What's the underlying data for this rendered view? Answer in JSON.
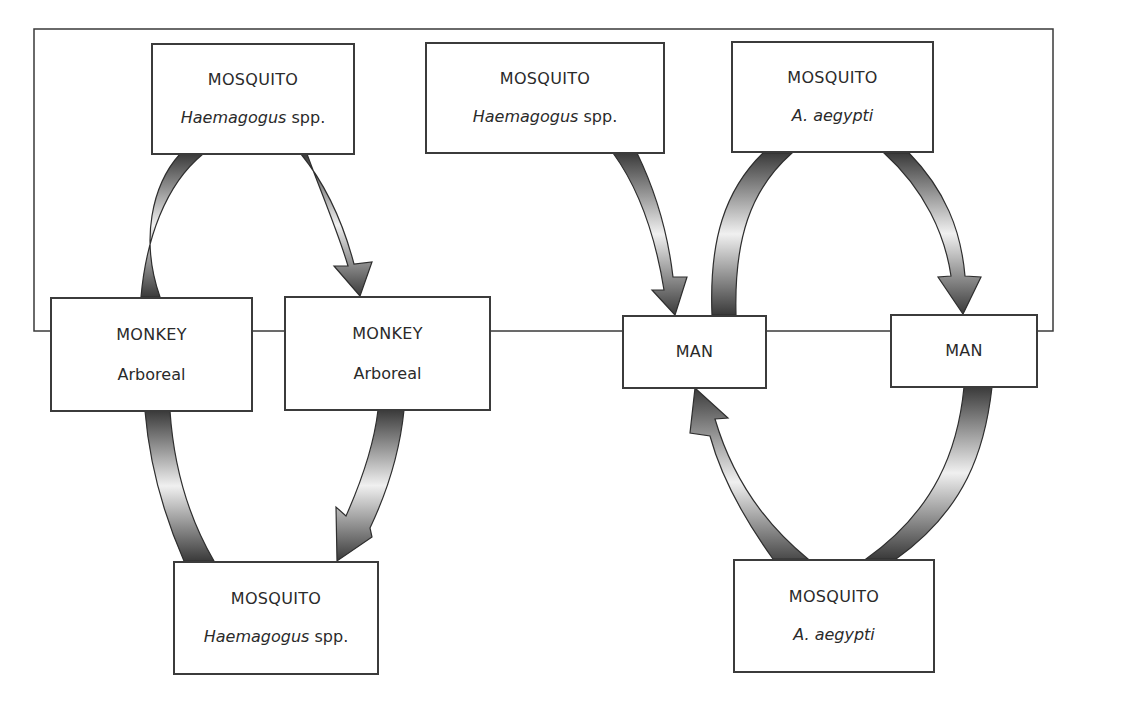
{
  "diagram": {
    "left_cycle": {
      "name": "sylvatic cycle",
      "nodes": {
        "top_mosquito": {
          "title": "MOSQUITO",
          "genus": "Haemagogus",
          "suffix": " spp."
        },
        "monkey_left": {
          "title": "MONKEY",
          "sub": "Arboreal"
        },
        "monkey_right": {
          "title": "MONKEY",
          "sub": "Arboreal"
        },
        "bottom_mosquito": {
          "title": "MOSQUITO",
          "genus": "Haemagogus",
          "suffix": " spp."
        }
      }
    },
    "bridge_mosquito": {
      "title": "MOSQUITO",
      "genus": "Haemagogus",
      "suffix": " spp."
    },
    "right_cycle": {
      "name": "urban cycle",
      "nodes": {
        "top_mosquito": {
          "title": "MOSQUITO",
          "sub": "A. aegypti"
        },
        "man_left": {
          "title": "MAN"
        },
        "man_right": {
          "title": "MAN"
        },
        "bottom_mosquito": {
          "title": "MOSQUITO",
          "sub": "A. aegypti"
        }
      }
    },
    "colors": {
      "border": "#3b3b3b",
      "arrow_dark": "#3a3a3a",
      "arrow_light": "#f2f2f2",
      "background": "#ffffff"
    }
  }
}
